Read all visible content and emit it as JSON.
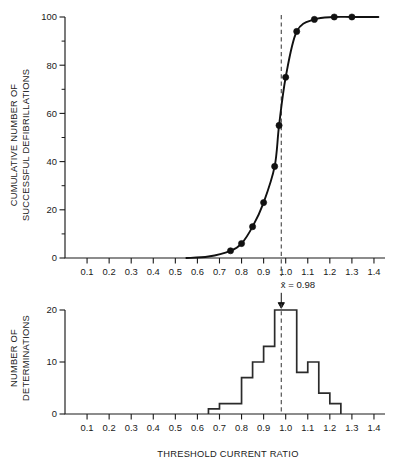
{
  "figure": {
    "background_color": "#ffffff",
    "ink_color": "#111111",
    "annotation": {
      "mean_label": "x̄ = 0.98",
      "mean_value": 0.98,
      "marker": "down-arrow"
    }
  },
  "chart_data": [
    {
      "type": "line",
      "panel": "top",
      "title": "",
      "xlabel": "",
      "ylabel": "CUMULATIVE NUMBER OF SUCCESSFUL DEFIBRILLATIONS",
      "ylabel_lines": [
        "CUMULATIVE NUMBER OF",
        "SUCCESSFUL DEFIBRILLATIONS"
      ],
      "xlim": [
        0.0,
        1.45
      ],
      "ylim": [
        0,
        100
      ],
      "xticks": [
        0.1,
        0.2,
        0.3,
        0.4,
        0.5,
        0.6,
        0.7,
        0.8,
        0.9,
        1.0,
        1.1,
        1.2,
        1.3,
        1.4
      ],
      "xticklabels": [
        "0.1",
        "0.2",
        "0.3",
        "0.4",
        "0.5",
        "0.6",
        "0.7",
        "0.8",
        "0.9",
        "1.0",
        "1.1",
        "1.2",
        "1.3",
        "1.4"
      ],
      "yticks": [
        0,
        20,
        40,
        60,
        80,
        100
      ],
      "yticklabels": [
        "0",
        "20",
        "40",
        "60",
        "80",
        "100"
      ],
      "yticks_minor": [
        10,
        30,
        50,
        70,
        90
      ],
      "grid": false,
      "legend": "none",
      "series": [
        {
          "name": "Cumulative successful defibrillations",
          "x": [
            0.75,
            0.8,
            0.85,
            0.9,
            0.95,
            0.97,
            1.0,
            1.05,
            1.13,
            1.22,
            1.3
          ],
          "values": [
            3,
            6,
            13,
            23,
            38,
            55,
            75,
            94,
            99,
            100,
            100
          ],
          "marker": "filled-circle",
          "line": "sigmoid-smooth"
        }
      ],
      "reference_line": {
        "orientation": "vertical",
        "value": 0.98,
        "style": "dashed",
        "label": "x̄ = 0.98"
      }
    },
    {
      "type": "bar",
      "panel": "bottom",
      "title": "",
      "xlabel": "THRESHOLD CURRENT RATIO",
      "ylabel": "NUMBER OF DETERMINATIONS",
      "ylabel_lines": [
        "NUMBER OF",
        "DETERMINATIONS"
      ],
      "xlim": [
        0.0,
        1.45
      ],
      "ylim": [
        0,
        21
      ],
      "xticks": [
        0.1,
        0.2,
        0.3,
        0.4,
        0.5,
        0.6,
        0.7,
        0.8,
        0.9,
        1.0,
        1.1,
        1.2,
        1.3,
        1.4
      ],
      "xticklabels": [
        "0.1",
        "0.2",
        "0.3",
        "0.4",
        "0.5",
        "0.6",
        "0.7",
        "0.8",
        "0.9",
        "1.0",
        "1.1",
        "1.2",
        "1.3",
        "1.4"
      ],
      "yticks": [
        0,
        10,
        20
      ],
      "yticklabels": [
        "0",
        "10",
        "20"
      ],
      "grid": false,
      "legend": "none",
      "bin_width": 0.05,
      "bin_edges": [
        0.65,
        0.7,
        0.75,
        0.8,
        0.85,
        0.9,
        0.95,
        1.0,
        1.05,
        1.1,
        1.15,
        1.2,
        1.25
      ],
      "categories": [
        "0.65-0.70",
        "0.70-0.75",
        "0.75-0.80",
        "0.80-0.85",
        "0.85-0.90",
        "0.90-0.95",
        "0.95-1.00",
        "1.00-1.05",
        "1.05-1.10",
        "1.10-1.15",
        "1.15-1.20",
        "1.20-1.25"
      ],
      "values": [
        1,
        2,
        2,
        7,
        10,
        13,
        20,
        20,
        8,
        10,
        4,
        2
      ],
      "reference_line": {
        "orientation": "vertical",
        "value": 0.98,
        "style": "dashed",
        "label": "x̄ = 0.98"
      }
    }
  ]
}
